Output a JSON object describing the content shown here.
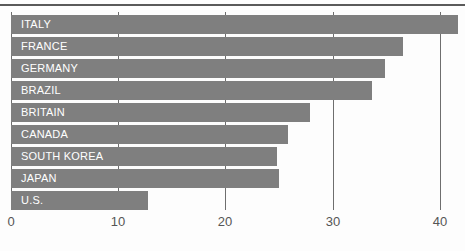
{
  "chart_data": {
    "type": "bar",
    "orientation": "horizontal",
    "title": "",
    "xlabel": "",
    "ylabel": "",
    "categories": [
      "ITALY",
      "FRANCE",
      "GERMANY",
      "BRAZIL",
      "BRITAIN",
      "CANADA",
      "SOUTH KOREA",
      "JAPAN",
      "U.S."
    ],
    "values": [
      41.7,
      36.6,
      34.9,
      33.7,
      27.9,
      25.8,
      24.8,
      25.0,
      12.8
    ],
    "xlim": [
      0,
      41.7
    ],
    "xticks": [
      0,
      10,
      20,
      30,
      40
    ],
    "xtick_labels": [
      "0",
      "10",
      "20",
      "30",
      "40"
    ],
    "grid": "vertical",
    "legend": "none",
    "bar_color": "#7f7f7f",
    "label_color": "#ffffff",
    "gridline_color": "#6e6e6e",
    "tick_label_color": "#555555",
    "rule_color": "#5a5a5a"
  },
  "caption": {
    "bottom_partial_text": ""
  }
}
